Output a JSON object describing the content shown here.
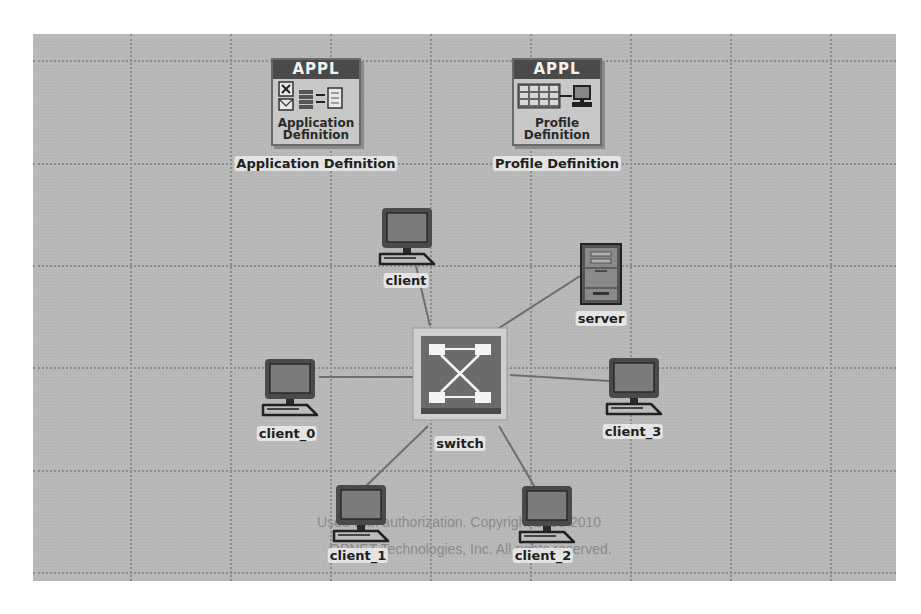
{
  "canvas": {
    "background": "#b9b9b9",
    "grid_x": [
      97,
      197,
      297,
      397,
      497,
      597,
      697,
      797
    ],
    "grid_y": [
      26,
      129,
      231,
      333,
      436,
      538
    ]
  },
  "nodes": {
    "application_definition": {
      "badge": "APPL",
      "inner_text_line1": "Application",
      "inner_text_line2": "Definition",
      "label": "Application Definition",
      "icon": "application-config-icon"
    },
    "profile_definition": {
      "badge": "APPL",
      "inner_text_line1": "Profile",
      "inner_text_line2": "Definition",
      "label": "Profile Definition",
      "icon": "profile-config-icon"
    },
    "client": {
      "label": "client",
      "icon": "workstation-icon"
    },
    "server": {
      "label": "server",
      "icon": "server-icon"
    },
    "switch": {
      "label": "switch",
      "icon": "switch-icon"
    },
    "client_0": {
      "label": "client_0",
      "icon": "workstation-icon"
    },
    "client_1": {
      "label": "client_1",
      "icon": "workstation-icon"
    },
    "client_2": {
      "label": "client_2",
      "icon": "workstation-icon"
    },
    "client_3": {
      "label": "client_3",
      "icon": "workstation-icon"
    }
  },
  "links": [
    {
      "from": "switch",
      "to": "client"
    },
    {
      "from": "switch",
      "to": "server"
    },
    {
      "from": "switch",
      "to": "client_0"
    },
    {
      "from": "switch",
      "to": "client_1"
    },
    {
      "from": "switch",
      "to": "client_2"
    },
    {
      "from": "switch",
      "to": "client_3"
    }
  ],
  "watermark": {
    "line1": "Used with authorization. Copyright 1986-2010",
    "line2": "OPNET Technologies, Inc. All rights reserved."
  }
}
